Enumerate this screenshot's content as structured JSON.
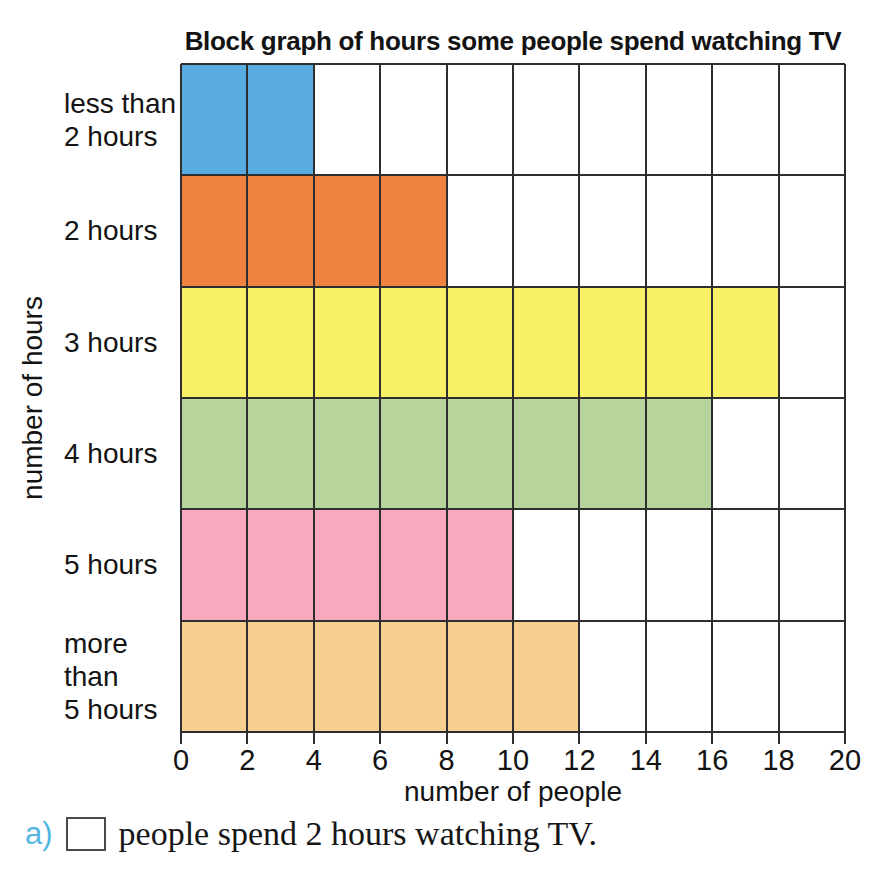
{
  "chart_data": {
    "type": "bar",
    "orientation": "horizontal",
    "title": "Block graph of hours some people spend watching TV",
    "categories": [
      "less than 2 hours",
      "2 hours",
      "3 hours",
      "4 hours",
      "5 hours",
      "more than 5 hours"
    ],
    "category_lines": [
      [
        "less than",
        "2 hours"
      ],
      [
        "2 hours"
      ],
      [
        "3 hours"
      ],
      [
        "4 hours"
      ],
      [
        "5 hours"
      ],
      [
        "more",
        "than",
        "5 hours"
      ]
    ],
    "values": [
      4,
      8,
      18,
      16,
      10,
      12
    ],
    "bar_colors": [
      "#58ACE2",
      "#EE8440",
      "#F8F168",
      "#B6D49C",
      "#F7AABE",
      "#F8CF92"
    ],
    "xlabel": "number of people",
    "ylabel": "number of hours",
    "xlim": [
      0,
      20
    ],
    "x_ticks": [
      0,
      2,
      4,
      6,
      8,
      10,
      12,
      14,
      16,
      18,
      20
    ],
    "grid": true,
    "grid_color": "#2e2e2e",
    "legend": "none"
  },
  "question": {
    "letter": "a)",
    "letter_color": "#55B7DF",
    "text": "people spend 2 hours watching TV."
  }
}
